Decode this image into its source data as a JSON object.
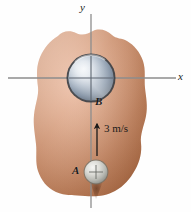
{
  "figure": {
    "axes": {
      "y_label": "y",
      "x_label": "x"
    },
    "bodies": [
      {
        "id": "B",
        "label": "B",
        "kind": "large-sphere",
        "cx": 91,
        "cy": 78,
        "r": 24,
        "color": "#8c9aab"
      },
      {
        "id": "A",
        "label": "A",
        "kind": "small-sphere",
        "cx": 96,
        "cy": 172,
        "r": 12,
        "color": "#b9bcb8"
      }
    ],
    "vector": {
      "label": "3 m/s",
      "magnitude": "3",
      "unit": "m/s",
      "direction": "up"
    },
    "surface": {
      "name": "irregular-brown-blob",
      "color_light": "#e3b49c",
      "color_mid": "#c98f6e",
      "color_dark": "#a9663f"
    }
  }
}
